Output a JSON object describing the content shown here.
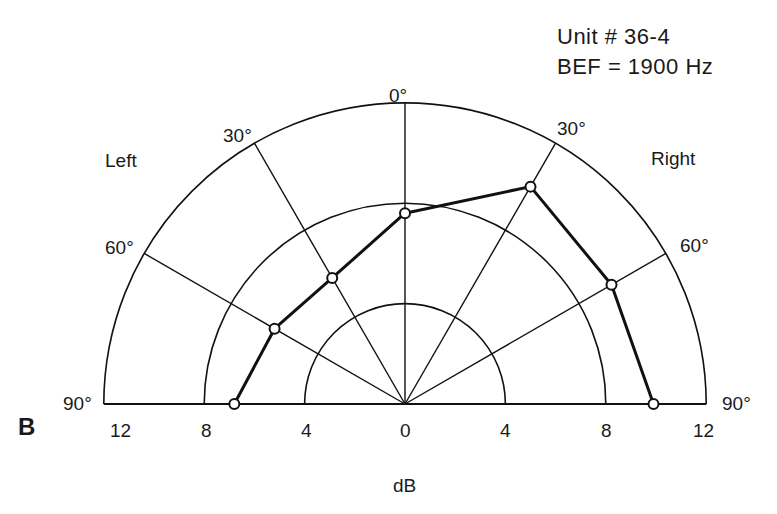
{
  "chart_data": {
    "type": "polar",
    "title": "Unit # 36-4",
    "subtitle": "BEF = 1900 Hz",
    "panel_label": "B",
    "xlabel": "dB",
    "side_labels": {
      "left": "Left",
      "right": "Right"
    },
    "angle_labels": [
      "90°",
      "60°",
      "30°",
      "0°",
      "30°",
      "60°",
      "90°"
    ],
    "radial_ticks": [
      "12",
      "8",
      "4",
      "0",
      "4",
      "8",
      "12"
    ],
    "radial_rings_db": [
      4,
      8,
      12
    ],
    "rlim": [
      0,
      12
    ],
    "grid": true,
    "series": [
      {
        "name": "Unit 36-4",
        "angles_deg": [
          -90,
          -60,
          -30,
          0,
          30,
          60,
          90
        ],
        "angle_names": [
          "Left 90°",
          "Left 60°",
          "Left 30°",
          "0°",
          "Right 30°",
          "Right 60°",
          "Right 90°"
        ],
        "values_db": [
          6.8,
          6.0,
          5.8,
          7.6,
          10.0,
          9.5,
          9.9
        ]
      }
    ]
  },
  "labels": {
    "unit": "Unit # 36-4",
    "bef": "BEF = 1900 Hz",
    "left": "Left",
    "right": "Right",
    "panel": "B",
    "axis": "dB",
    "a0": "0°",
    "aL30": "30°",
    "aR30": "30°",
    "aL60": "60°",
    "aR60": "60°",
    "aL90": "90°",
    "aR90": "90°",
    "t0": "12",
    "t1": "8",
    "t2": "4",
    "t3": "0",
    "t4": "4",
    "t5": "8",
    "t6": "12"
  }
}
